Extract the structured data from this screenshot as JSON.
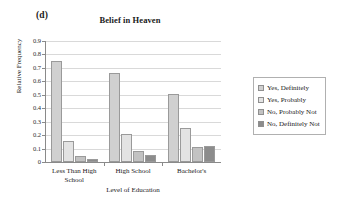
{
  "panel_label": "(d)",
  "chart_data": {
    "type": "bar",
    "title": "Belief in Heaven",
    "xlabel": "Level of Education",
    "ylabel": "Relative Frequency",
    "categories": [
      "Less Than High School",
      "High School",
      "Bachelor's"
    ],
    "category_lines": [
      [
        "Less Than High",
        "School"
      ],
      [
        "High School"
      ],
      [
        "Bachelor's"
      ]
    ],
    "series": [
      {
        "name": "Yes, Definitely",
        "color": "#d0d0d0",
        "values": [
          0.755,
          0.66,
          0.505
        ]
      },
      {
        "name": "Yes, Probably",
        "color": "#e3e3e3",
        "values": [
          0.155,
          0.205,
          0.25
        ]
      },
      {
        "name": "No, Probably Not",
        "color": "#c2c2c2",
        "values": [
          0.045,
          0.085,
          0.115
        ]
      },
      {
        "name": "No, Definitely Not",
        "color": "#8c8c8c",
        "values": [
          0.02,
          0.05,
          0.12
        ]
      }
    ],
    "ylim": [
      0,
      0.9
    ],
    "ytick_labels": [
      "0.9",
      "0.8",
      "0.7",
      "0.6",
      "0.5",
      "0.4",
      "0.3",
      "0.2",
      "0.1",
      "0"
    ],
    "ytick_values": [
      0.9,
      0.8,
      0.7,
      0.6,
      0.5,
      0.4,
      0.3,
      0.2,
      0.1,
      0
    ],
    "grid": true,
    "legend_position": "right"
  },
  "legend": {
    "items": [
      {
        "label": "Yes, Definitely",
        "color": "#d0d0d0"
      },
      {
        "label": "Yes, Probably",
        "color": "#e3e3e3"
      },
      {
        "label": "No, Probably Not",
        "color": "#c2c2c2"
      },
      {
        "label": "No, Definitely Not",
        "color": "#8c8c8c"
      }
    ]
  }
}
